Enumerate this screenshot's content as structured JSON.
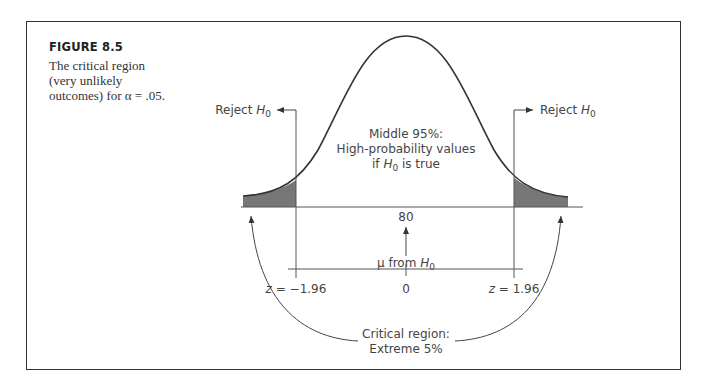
{
  "figure": {
    "title": "FIGURE 8.5",
    "caption": "The critical region (very unlikely outcomes) for α = .05."
  },
  "diagram": {
    "reject_left": {
      "text": "Reject ",
      "var": "H",
      "sub": "0"
    },
    "reject_right": {
      "text": "Reject ",
      "var": "H",
      "sub": "0"
    },
    "middle_line1": "Middle 95%:",
    "middle_line2": "High-probability values",
    "middle_line3_pre": "if ",
    "middle_line3_var": "H",
    "middle_line3_sub": "0",
    "middle_line3_post": " is true",
    "mean_value": "80",
    "mu_label_pre": "μ from ",
    "mu_label_var": "H",
    "mu_label_sub": "0",
    "z_left_var": "z",
    "z_left_val": " = −1.96",
    "z_center": "0",
    "z_right_var": "z",
    "z_right_val": " = 1.96",
    "critical_line1": "Critical region:",
    "critical_line2": "Extreme 5%"
  },
  "colors": {
    "shade": "#777777",
    "line": "#333333"
  }
}
